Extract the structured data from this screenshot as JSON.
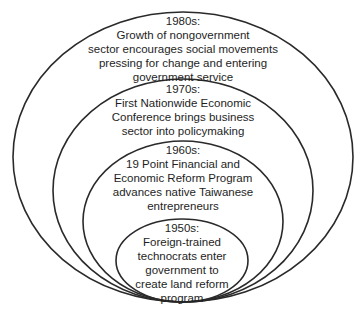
{
  "diagram": {
    "type": "nested-ellipses",
    "levels": [
      {
        "decade": "1980s:",
        "lines": [
          "Growth of nongovernment",
          "sector encourages social movements",
          "pressing for change and entering",
          "government service"
        ]
      },
      {
        "decade": "1970s:",
        "lines": [
          "First Nationwide Economic",
          "Conference brings business",
          "sector into policymaking"
        ]
      },
      {
        "decade": "1960s:",
        "lines": [
          "19 Point Financial and",
          "Economic Reform Program",
          "advances native Taiwanese",
          "entrepreneurs"
        ]
      },
      {
        "decade": "1950s:",
        "lines": [
          "Foreign-trained",
          "technocrats enter",
          "government to",
          "create land reform",
          "program"
        ]
      }
    ]
  }
}
